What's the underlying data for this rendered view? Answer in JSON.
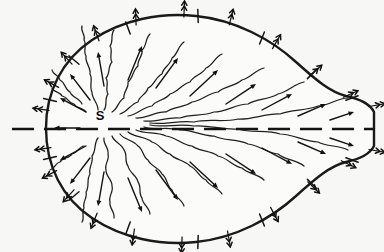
{
  "figure": {
    "background_color": "#f7f7f5",
    "ink_color": "#111111",
    "width": 384,
    "height": 252
  },
  "labels": {
    "source": "S",
    "source_x": 100,
    "source_y": 120
  },
  "axis": {
    "name": "symmetry-axis",
    "style": "dashed",
    "y": 129,
    "x_start": 12,
    "x_end": 374,
    "dash_length": 22,
    "gap_length": 10
  },
  "boundary": {
    "name": "closed-boundary-curve",
    "shape": "teardrop",
    "path": "M 46 128 C 46 92 62 60 92 40 C 122 20 160 12 196 16 C 236 20 272 40 296 62 C 316 80 330 92 346 96 C 360 99 370 104 374 112 L 374 146 C 370 154 360 159 346 162 C 330 166 316 178 296 196 C 272 218 236 238 196 242 C 160 246 122 238 92 218 C 62 198 46 166 46 128 Z"
  },
  "boundary_ticks": [
    {
      "x": 74,
      "y": 60,
      "angle": 40
    },
    {
      "x": 128,
      "y": 28,
      "angle": 70
    },
    {
      "x": 198,
      "y": 16,
      "angle": 88
    },
    {
      "x": 262,
      "y": 38,
      "angle": 112
    },
    {
      "x": 312,
      "y": 74,
      "angle": 135
    },
    {
      "x": 352,
      "y": 98,
      "angle": 160
    },
    {
      "x": 50,
      "y": 100,
      "angle": 12
    },
    {
      "x": 50,
      "y": 158,
      "angle": 168
    },
    {
      "x": 74,
      "y": 196,
      "angle": 140
    },
    {
      "x": 128,
      "y": 228,
      "angle": 110
    },
    {
      "x": 198,
      "y": 242,
      "angle": 92
    },
    {
      "x": 262,
      "y": 220,
      "angle": 68
    },
    {
      "x": 312,
      "y": 184,
      "angle": 45
    },
    {
      "x": 352,
      "y": 160,
      "angle": 20
    }
  ],
  "wavy_streamlines": [
    {
      "id": "w-up-1",
      "points": "98 110 92 92 90 74 86 56 84 40 82 26"
    },
    {
      "id": "w-up-2",
      "points": "104 110 108 94 106 78 112 62 110 46 114 30"
    },
    {
      "id": "w-up-3",
      "points": "112 112 124 98 128 82 138 66 142 50 150 34"
    },
    {
      "id": "w-up-4",
      "points": "120 114 138 102 148 88 162 74 172 58 184 42"
    },
    {
      "id": "w-up-5",
      "points": "128 116 152 106 170 94 190 82 206 68 222 54"
    },
    {
      "id": "w-up-6",
      "points": "136 118 166 112 192 102 218 92 242 80 264 68"
    },
    {
      "id": "w-up-7",
      "points": "144 121 180 118 214 112 248 104 278 94 304 82"
    },
    {
      "id": "w-up-8",
      "points": "150 123 194 122 238 119 280 114 318 106 348 98"
    },
    {
      "id": "w-dn-1",
      "points": "98 138 92 156 90 174 86 192 84 208 82 222"
    },
    {
      "id": "w-dn-2",
      "points": "104 138 108 154 106 170 112 186 110 202 114 218"
    },
    {
      "id": "w-dn-3",
      "points": "112 136 124 150 128 166 138 182 142 198 150 214"
    },
    {
      "id": "w-dn-4",
      "points": "120 134 138 146 148 160 162 174 172 190 184 206"
    },
    {
      "id": "w-dn-5",
      "points": "128 132 152 142 170 154 190 166 206 180 222 194"
    },
    {
      "id": "w-dn-6",
      "points": "136 130 166 136 192 146 218 156 242 168 264 180"
    },
    {
      "id": "w-dn-7",
      "points": "144 127 180 130 214 136 248 144 278 154 304 166"
    },
    {
      "id": "w-dn-8",
      "points": "150 125 194 126 238 129 280 134 318 142 348 150"
    },
    {
      "id": "w-lt-1",
      "points": "86 112 74 104 62 96 52 88"
    },
    {
      "id": "w-lt-2",
      "points": "84 146 72 154 60 162 50 170"
    },
    {
      "id": "w-lt-3",
      "points": "82 104 70 92 60 80 52 70"
    }
  ],
  "interior_arrows": [
    {
      "x1": 80,
      "y1": 128,
      "x2": 54,
      "y2": 128
    },
    {
      "x1": 86,
      "y1": 112,
      "x2": 60,
      "y2": 98
    },
    {
      "x1": 86,
      "y1": 146,
      "x2": 60,
      "y2": 160
    },
    {
      "x1": 90,
      "y1": 100,
      "x2": 70,
      "y2": 74
    },
    {
      "x1": 90,
      "y1": 158,
      "x2": 70,
      "y2": 184
    },
    {
      "x1": 104,
      "y1": 86,
      "x2": 98,
      "y2": 52
    },
    {
      "x1": 104,
      "y1": 172,
      "x2": 98,
      "y2": 206
    },
    {
      "x1": 128,
      "y1": 80,
      "x2": 142,
      "y2": 46
    },
    {
      "x1": 128,
      "y1": 178,
      "x2": 142,
      "y2": 212
    },
    {
      "x1": 156,
      "y1": 88,
      "x2": 178,
      "y2": 58
    },
    {
      "x1": 156,
      "y1": 170,
      "x2": 178,
      "y2": 200
    },
    {
      "x1": 190,
      "y1": 96,
      "x2": 218,
      "y2": 70
    },
    {
      "x1": 190,
      "y1": 162,
      "x2": 218,
      "y2": 188
    },
    {
      "x1": 226,
      "y1": 104,
      "x2": 256,
      "y2": 84
    },
    {
      "x1": 226,
      "y1": 154,
      "x2": 256,
      "y2": 174
    },
    {
      "x1": 262,
      "y1": 110,
      "x2": 292,
      "y2": 94
    },
    {
      "x1": 262,
      "y1": 148,
      "x2": 292,
      "y2": 164
    },
    {
      "x1": 298,
      "y1": 116,
      "x2": 326,
      "y2": 104
    },
    {
      "x1": 298,
      "y1": 142,
      "x2": 326,
      "y2": 154
    },
    {
      "x1": 330,
      "y1": 120,
      "x2": 354,
      "y2": 112
    },
    {
      "x1": 330,
      "y1": 138,
      "x2": 354,
      "y2": 146
    }
  ],
  "boundary_outflow_arrows": [
    {
      "x": 46,
      "y": 110,
      "angle": 188
    },
    {
      "x": 48,
      "y": 148,
      "angle": 172
    },
    {
      "x": 54,
      "y": 172,
      "angle": 152
    },
    {
      "x": 56,
      "y": 86,
      "angle": 208
    },
    {
      "x": 70,
      "y": 62,
      "angle": 228
    },
    {
      "x": 72,
      "y": 192,
      "angle": 132
    },
    {
      "x": 96,
      "y": 216,
      "angle": 112
    },
    {
      "x": 98,
      "y": 38,
      "angle": 250
    },
    {
      "x": 134,
      "y": 232,
      "angle": 98
    },
    {
      "x": 136,
      "y": 22,
      "angle": 268
    },
    {
      "x": 182,
      "y": 240,
      "angle": 92
    },
    {
      "x": 184,
      "y": 14,
      "angle": 272
    },
    {
      "x": 228,
      "y": 234,
      "angle": 80
    },
    {
      "x": 230,
      "y": 22,
      "angle": 284
    },
    {
      "x": 272,
      "y": 210,
      "angle": 62
    },
    {
      "x": 274,
      "y": 46,
      "angle": 300
    },
    {
      "x": 310,
      "y": 184,
      "angle": 44
    },
    {
      "x": 312,
      "y": 74,
      "angle": 318
    },
    {
      "x": 344,
      "y": 162,
      "angle": 26
    },
    {
      "x": 346,
      "y": 96,
      "angle": 336
    },
    {
      "x": 372,
      "y": 150,
      "angle": 10
    },
    {
      "x": 372,
      "y": 106,
      "angle": 350
    }
  ]
}
